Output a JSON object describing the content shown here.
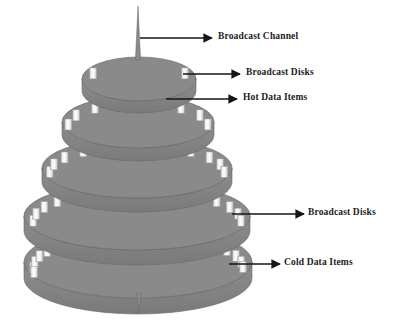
{
  "figure": {
    "background_color": "#ffffff"
  },
  "colors": {
    "disk_fill": "#8a8a8a",
    "disk_fill_dark": "#7c7c7c",
    "disk_edge": "#6a6a6a",
    "data_item_light": "#f6f6f6",
    "data_item_mid": "#d2d2d2",
    "data_item_edge": "#9a9a9a",
    "spire": "#8a8a8a",
    "arrow": "#161616",
    "text": "#1c1c1c"
  },
  "annotations": [
    {
      "id": "broadcast-channel",
      "label": "Broadcast Channel",
      "text_x": 218,
      "text_y": 32,
      "arrow": {
        "x1": 140,
        "y1": 38,
        "x2": 212,
        "y2": 38
      }
    },
    {
      "id": "broadcast-disks-top",
      "label": "Broadcast Disks",
      "text_x": 246,
      "text_y": 68,
      "arrow": {
        "x1": 183,
        "y1": 74,
        "x2": 240,
        "y2": 74
      }
    },
    {
      "id": "hot-data-items",
      "label": "Hot Data Items",
      "text_x": 243,
      "text_y": 93,
      "arrow": {
        "x1": 166,
        "y1": 99,
        "x2": 237,
        "y2": 99
      }
    },
    {
      "id": "broadcast-disks-bottom",
      "label": "Broadcast Disks",
      "text_x": 310,
      "text_y": 208,
      "arrow": {
        "x1": 232,
        "y1": 214,
        "x2": 304,
        "y2": 214
      }
    },
    {
      "id": "cold-data-items",
      "label": "Cold Data Items",
      "text_x": 286,
      "text_y": 258,
      "arrow": {
        "x1": 229,
        "y1": 264,
        "x2": 280,
        "y2": 264
      }
    }
  ],
  "spires": [
    {
      "id": "top-spire",
      "cx": 138,
      "y_top": 6,
      "y_bottom": 60,
      "half_width": 2.6
    },
    {
      "id": "bottom-spire",
      "cx": 139,
      "y_top": 293,
      "y_bottom": 311,
      "half_width": 2.4
    }
  ],
  "disks": [
    {
      "id": "disk-1-top",
      "level": 1,
      "cx": 139,
      "cy": 79,
      "rx": 57,
      "ry": 22,
      "thickness": 12,
      "item_count": 2,
      "data_item_class": "hot",
      "items_angles": [
        209,
        331
      ]
    },
    {
      "id": "disk-2",
      "level": 2,
      "cx": 138,
      "cy": 122,
      "rx": 76,
      "ry": 26,
      "thickness": 13,
      "item_count": 6,
      "data_item_class": "hot",
      "items_angles": [
        185,
        208,
        232,
        308,
        332,
        355
      ]
    },
    {
      "id": "disk-3",
      "level": 3,
      "cx": 137,
      "cy": 168,
      "rx": 95,
      "ry": 30,
      "thickness": 14,
      "item_count": 9,
      "data_item_class": "warm",
      "items_angles": [
        182,
        198,
        214,
        232,
        270,
        308,
        326,
        342,
        358
      ]
    },
    {
      "id": "disk-4",
      "level": 4,
      "cx": 137,
      "cy": 216,
      "rx": 113,
      "ry": 34,
      "thickness": 15,
      "item_count": 12,
      "data_item_class": "warm",
      "items_angles": [
        181,
        194,
        207,
        220,
        233,
        248,
        292,
        307,
        320,
        333,
        346,
        359
      ]
    },
    {
      "id": "disk-5-bottom",
      "level": 5,
      "cx": 138,
      "cy": 262,
      "rx": 114,
      "ry": 36,
      "thickness": 16,
      "item_count": 18,
      "data_item_class": "cold",
      "items_angles": [
        180,
        190,
        200,
        210,
        221,
        232,
        244,
        256,
        268,
        280,
        292,
        304,
        316,
        328,
        339,
        350,
        359,
        172
      ]
    }
  ],
  "data_item": {
    "width": 7,
    "height": 11,
    "description": "small white rectangular data item on disk rim"
  },
  "legend_terms": {
    "hot": "Hot Data Items",
    "cold": "Cold Data Items",
    "channel": "Broadcast Channel",
    "disks": "Broadcast Disks"
  }
}
